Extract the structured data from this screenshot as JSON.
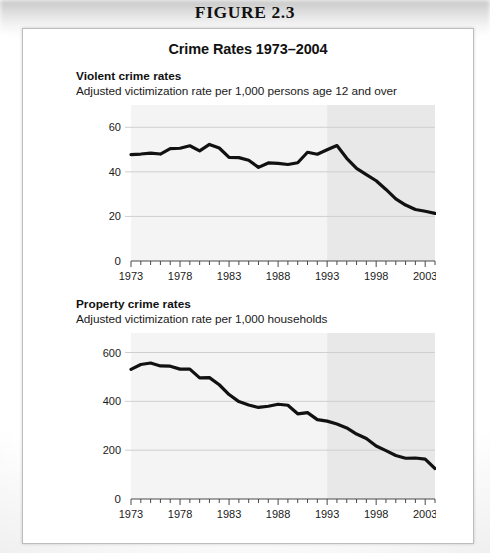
{
  "figure": {
    "caption": "FIGURE 2.3",
    "panel_title": "Crime Rates 1973–2004"
  },
  "colors": {
    "line": "#111111",
    "gridline": "#cfcfcf",
    "plot_background": "#f4f4f4",
    "plot_background_shaded": "#e8e8e8",
    "axis": "#4a4a4a",
    "text": "#111111",
    "panel_border": "#bdbdbd"
  },
  "charts": [
    {
      "id": "violent-crime-rates",
      "heading": "Violent crime rates",
      "subheading": "Adjusted victimization rate per 1,000 persons age 12 and over",
      "chart_data": {
        "type": "line",
        "title": "Violent crime rates",
        "subtitle": "Adjusted victimization rate per 1,000 persons age 12 and over",
        "xlabel": "",
        "ylabel": "",
        "xlim": [
          1973,
          2004
        ],
        "ylim": [
          0,
          70
        ],
        "yticks": [
          0,
          20,
          40,
          60
        ],
        "ytick_labels": [
          "0",
          "20",
          "40",
          "60"
        ],
        "xticks": [
          1973,
          1978,
          1983,
          1988,
          1993,
          1998,
          2003
        ],
        "xtick_labels": [
          "1973",
          "1978",
          "1983",
          "1988",
          "1993",
          "1998",
          "2003"
        ],
        "minor_xticks_every": 1,
        "grid": "horizontal",
        "legend": "none",
        "shaded_region": {
          "from": 1993,
          "to": 2004
        },
        "x": [
          1973,
          1974,
          1975,
          1976,
          1977,
          1978,
          1979,
          1980,
          1981,
          1982,
          1983,
          1984,
          1985,
          1986,
          1987,
          1988,
          1989,
          1990,
          1991,
          1992,
          1993,
          1994,
          1995,
          1996,
          1997,
          1998,
          1999,
          2000,
          2001,
          2002,
          2003,
          2004
        ],
        "values": [
          47.7,
          48.0,
          48.4,
          48.0,
          50.4,
          50.6,
          51.7,
          49.4,
          52.3,
          50.7,
          46.5,
          46.4,
          45.2,
          42.0,
          44.0,
          43.8,
          43.3,
          44.1,
          48.8,
          47.9,
          49.9,
          51.8,
          46.1,
          41.6,
          38.8,
          36.0,
          32.1,
          27.9,
          25.1,
          23.1,
          22.3,
          21.4
        ]
      }
    },
    {
      "id": "property-crime-rates",
      "heading": "Property crime rates",
      "subheading": "Adjusted victimization rate per 1,000 households",
      "chart_data": {
        "type": "line",
        "title": "Property crime rates",
        "subtitle": "Adjusted victimization rate per 1,000 households",
        "xlabel": "",
        "ylabel": "",
        "xlim": [
          1973,
          2004
        ],
        "ylim": [
          0,
          680
        ],
        "yticks": [
          0,
          200,
          400,
          600
        ],
        "ytick_labels": [
          "0",
          "200",
          "400",
          "600"
        ],
        "xticks": [
          1973,
          1978,
          1983,
          1988,
          1993,
          1998,
          2003
        ],
        "xtick_labels": [
          "1973",
          "1978",
          "1983",
          "1988",
          "1993",
          "1998",
          "2003"
        ],
        "minor_xticks_every": 1,
        "grid": "horizontal",
        "legend": "none",
        "shaded_region": {
          "from": 1993,
          "to": 2004
        },
        "x": [
          1973,
          1974,
          1975,
          1976,
          1977,
          1978,
          1979,
          1980,
          1981,
          1982,
          1983,
          1984,
          1985,
          1986,
          1987,
          1988,
          1989,
          1990,
          1991,
          1992,
          1993,
          1994,
          1995,
          1996,
          1997,
          1998,
          1999,
          2000,
          2001,
          2002,
          2003,
          2004
        ],
        "values": [
          531,
          551,
          557,
          545,
          544,
          532,
          532,
          496,
          497,
          468,
          428,
          399,
          385,
          375,
          380,
          388,
          384,
          349,
          354,
          325,
          319,
          307,
          291,
          266,
          248,
          217,
          198,
          178,
          167,
          168,
          163,
          125
        ]
      }
    }
  ]
}
